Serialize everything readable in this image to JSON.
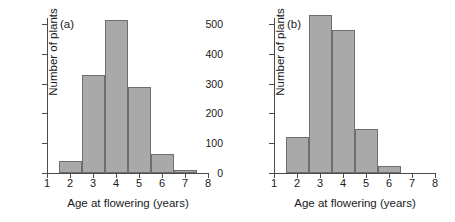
{
  "figure": {
    "background": "#ffffff",
    "bar_fill": "#a9a9a9",
    "bar_stroke": "#6e6e6e",
    "axis_color": "#4a4a4a"
  },
  "panels": [
    {
      "tag": "(a)",
      "xlabel": "Age at flowering (years)",
      "ylabel": "Number of plants",
      "yticks": [
        "0",
        "100",
        "200",
        "300",
        "400",
        "500"
      ],
      "xticks": [
        "1",
        "2",
        "3",
        "4",
        "5",
        "6",
        "7",
        "8"
      ]
    },
    {
      "tag": "(b)",
      "xlabel": "Age at flowering (years)",
      "ylabel": "Number of plants",
      "yticks": [
        "0",
        "100",
        "200",
        "300",
        "400",
        "500"
      ],
      "xticks": [
        "1",
        "2",
        "3",
        "4",
        "5",
        "6",
        "7",
        "8"
      ]
    }
  ],
  "chart_data": [
    {
      "type": "bar",
      "title": "(a)",
      "xlabel": "Age at flowering (years)",
      "ylabel": "Number of plants",
      "categories": [
        "2",
        "3",
        "4",
        "5",
        "6",
        "7"
      ],
      "bin_edges": [
        1.5,
        2.5,
        3.5,
        4.5,
        5.5,
        6.5,
        7.5
      ],
      "values": [
        40,
        330,
        515,
        290,
        65,
        10
      ],
      "xlim": [
        1,
        8
      ],
      "ylim": [
        0,
        530
      ],
      "xticks": [
        1,
        2,
        3,
        4,
        5,
        6,
        7,
        8
      ],
      "yticks": [
        0,
        100,
        200,
        300,
        400,
        500
      ],
      "grid": false,
      "legend": false
    },
    {
      "type": "bar",
      "title": "(b)",
      "xlabel": "Age at flowering (years)",
      "ylabel": "Number of plants",
      "categories": [
        "2",
        "3",
        "4",
        "5",
        "6"
      ],
      "bin_edges": [
        1.5,
        2.5,
        3.5,
        4.5,
        5.5,
        6.5
      ],
      "values": [
        122,
        530,
        480,
        148,
        22
      ],
      "xlim": [
        1,
        8
      ],
      "ylim": [
        0,
        530
      ],
      "xticks": [
        1,
        2,
        3,
        4,
        5,
        6,
        7,
        8
      ],
      "yticks": [
        0,
        100,
        200,
        300,
        400,
        500
      ],
      "grid": false,
      "legend": false
    }
  ]
}
